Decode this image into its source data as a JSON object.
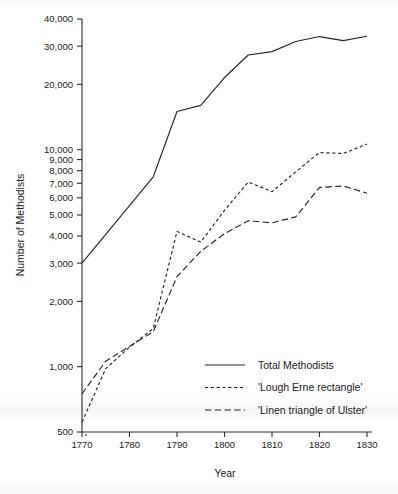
{
  "chart_data": {
    "type": "line",
    "title": "",
    "xlabel": "Year",
    "ylabel": "Number of Methodists",
    "yscale": "log",
    "ylim": [
      500,
      40000
    ],
    "xlim": [
      1770,
      1830
    ],
    "grid": false,
    "legend_position": "lower-right",
    "x_ticks": [
      1770,
      1780,
      1790,
      1800,
      1810,
      1820,
      1830
    ],
    "x_tick_labels": [
      "1770",
      "1780",
      "1790",
      "1800",
      "1810",
      "1820",
      "1830"
    ],
    "y_ticks": [
      500,
      1000,
      2000,
      3000,
      4000,
      5000,
      6000,
      7000,
      8000,
      9000,
      10000,
      20000,
      30000,
      40000
    ],
    "y_tick_labels": [
      "500",
      "1,000",
      "2,000",
      "3,000",
      "4,000",
      "5,000",
      "6,000",
      "7,000",
      "8,000",
      "9,000",
      "10,000",
      "20,000",
      "30,000",
      "40,000"
    ],
    "series": [
      {
        "name": "Total Methodists",
        "style": "solid",
        "x": [
          1770,
          1785,
          1790,
          1795,
          1800,
          1805,
          1810,
          1815,
          1820,
          1825,
          1830
        ],
        "values": [
          3000,
          7500,
          15000,
          16000,
          21500,
          27300,
          28300,
          31500,
          33200,
          31800,
          33300
        ]
      },
      {
        "name": "'Lough Erne rectangle'",
        "style": "dashed",
        "x": [
          1770,
          1775,
          1780,
          1785,
          1790,
          1795,
          1800,
          1805,
          1810,
          1815,
          1820,
          1825,
          1830
        ],
        "values": [
          555,
          980,
          1230,
          1500,
          4200,
          3750,
          5250,
          7100,
          6400,
          7900,
          9700,
          9600,
          10600
        ]
      },
      {
        "name": "'Linen triangle of Ulster'",
        "style": "dashdash",
        "x": [
          1770,
          1775,
          1780,
          1785,
          1790,
          1795,
          1800,
          1805,
          1810,
          1815,
          1820,
          1825,
          1830
        ],
        "values": [
          750,
          1060,
          1240,
          1450,
          2600,
          3400,
          4100,
          4700,
          4600,
          4900,
          6700,
          6800,
          6300
        ]
      }
    ]
  },
  "axis": {
    "x_title": "Year",
    "y_title": "Number of Methodists"
  },
  "legend": {
    "items": [
      {
        "label": "Total Methodists",
        "style": "solid"
      },
      {
        "label": "'Lough Erne rectangle'",
        "style": "dashed"
      },
      {
        "label": "'Linen triangle of Ulster'",
        "style": "dashdash"
      }
    ]
  }
}
